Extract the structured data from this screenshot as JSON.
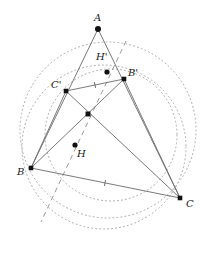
{
  "figure": {
    "type": "geometry-diagram",
    "width": 213,
    "height": 254,
    "background": "#ffffff",
    "stroke_solid": "#6b6b6b",
    "stroke_dotted": "#a9a9a9",
    "stroke_dashed": "#9a9a9a",
    "point_color": "#111111",
    "label_color": "#1a1a1a"
  },
  "points": [
    {
      "id": "A",
      "label": "A",
      "x": 98,
      "y": 29,
      "label_x": 94,
      "label_y": 13,
      "marker": "dot",
      "radius": 3.0
    },
    {
      "id": "B",
      "label": "B",
      "x": 31,
      "y": 168,
      "label_x": 17,
      "label_y": 167,
      "marker": "square",
      "radius": 2.4
    },
    {
      "id": "C",
      "label": "C",
      "x": 180,
      "y": 198,
      "label_x": 186,
      "label_y": 199,
      "marker": "square",
      "radius": 2.4
    },
    {
      "id": "Bp",
      "label": "B'",
      "x": 124,
      "y": 79,
      "label_x": 128,
      "label_y": 68,
      "marker": "square",
      "radius": 2.4
    },
    {
      "id": "Cp",
      "label": "C'",
      "x": 66,
      "y": 91,
      "label_x": 51,
      "label_y": 80,
      "marker": "square",
      "radius": 2.4
    },
    {
      "id": "Hp",
      "label": "H'",
      "x": 107,
      "y": 72,
      "label_x": 96,
      "label_y": 52,
      "marker": "dot",
      "radius": 2.6
    },
    {
      "id": "H",
      "label": "H",
      "x": 75,
      "y": 145,
      "label_x": 77,
      "label_y": 149,
      "marker": "dot",
      "radius": 2.6
    },
    {
      "id": "O",
      "label": "",
      "x": 88,
      "y": 114,
      "label_x": 0,
      "label_y": 0,
      "marker": "square",
      "radius": 2.6
    }
  ],
  "segments": [
    {
      "id": "A-B",
      "from": "A",
      "to": "B"
    },
    {
      "id": "A-C",
      "from": "A",
      "to": "C"
    },
    {
      "id": "B-C",
      "from": "B",
      "to": "C"
    },
    {
      "id": "Cp-Bp",
      "from": "Cp",
      "to": "Bp"
    },
    {
      "id": "B-Bp",
      "from": "B",
      "to": "Bp"
    },
    {
      "id": "Cp-C",
      "from": "Cp",
      "to": "C"
    },
    {
      "id": "Bp-C",
      "from": "Bp",
      "to": "C"
    },
    {
      "id": "B-Cp",
      "from": "B",
      "to": "Cp"
    }
  ],
  "dashed_line": {
    "id": "dashed-axis",
    "x1": 126,
    "y1": 41,
    "x2": 41,
    "y2": 222,
    "dash": "5 4"
  },
  "circles": [
    {
      "id": "circumcircle",
      "cx": 108,
      "cy": 130,
      "r": 88,
      "dash": "1 3"
    },
    {
      "id": "second-circle",
      "cx": 104,
      "cy": 147,
      "r": 82,
      "dash": "1 3"
    },
    {
      "id": "nine-point-circle",
      "cx": 111,
      "cy": 135,
      "r": 66,
      "dash": "1 3"
    }
  ],
  "tick_marks": [
    {
      "id": "tick-CpBp",
      "x": 95,
      "y": 85,
      "angle": -12
    },
    {
      "id": "tick-BC",
      "x": 105,
      "y": 183,
      "angle": 11
    }
  ]
}
